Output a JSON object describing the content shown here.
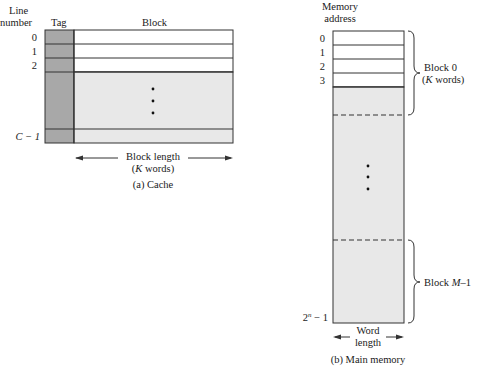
{
  "cache": {
    "header_line_number": [
      "Line",
      "number"
    ],
    "header_tag": "Tag",
    "header_block": "Block",
    "line_labels": [
      "0",
      "1",
      "2",
      "C − 1"
    ],
    "block_length_label": [
      "Block length",
      "(K words)"
    ],
    "caption": "(a) Cache"
  },
  "main_memory": {
    "header_memory_address": [
      "Memory",
      "address"
    ],
    "address_labels": [
      "0",
      "1",
      "2",
      "3",
      "2ⁿ − 1"
    ],
    "block0_label": [
      "Block 0",
      "(K words)"
    ],
    "blockM_label": "Block M–1",
    "word_length_label": [
      "Word",
      "length"
    ],
    "caption": "(b) Main memory"
  },
  "colors": {
    "tag_fill": "#a8a8a8",
    "block_gray_fill": "#e8e8e8",
    "line": "#333333",
    "white": "#ffffff"
  }
}
